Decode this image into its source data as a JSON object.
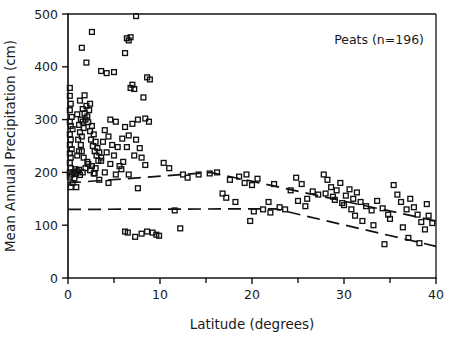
{
  "chart_data": {
    "type": "scatter",
    "title": "",
    "annotation": "Peats (n=196)",
    "xlabel": "Latitude (degrees)",
    "ylabel": "Mean Annual Precipitation (cm)",
    "xlim": [
      0,
      40
    ],
    "ylim": [
      0,
      500
    ],
    "xticks": [
      0,
      10,
      20,
      30,
      40
    ],
    "xticklabels": [
      "0",
      "10",
      "20",
      "30",
      "40"
    ],
    "xminorticks": [
      5,
      15,
      25,
      35
    ],
    "yticks": [
      0,
      100,
      200,
      300,
      400,
      500
    ],
    "yticklabels": [
      "0",
      "100",
      "200",
      "300",
      "400",
      "500"
    ],
    "grid": false,
    "legend": null,
    "marker": "open-square",
    "marker_color": "#111111",
    "n_points": 196,
    "series": [
      {
        "name": "Peats",
        "points": [
          [
            0.2,
            360
          ],
          [
            0.2,
            345
          ],
          [
            0.3,
            330
          ],
          [
            0.2,
            318
          ],
          [
            0.4,
            305
          ],
          [
            0.2,
            296
          ],
          [
            0.3,
            288
          ],
          [
            0.5,
            282
          ],
          [
            0.2,
            272
          ],
          [
            0.3,
            262
          ],
          [
            0.2,
            252
          ],
          [
            0.4,
            244
          ],
          [
            0.2,
            236
          ],
          [
            0.3,
            228
          ],
          [
            0.2,
            218
          ],
          [
            0.3,
            208
          ],
          [
            0.2,
            200
          ],
          [
            0.4,
            196
          ],
          [
            0.2,
            192
          ],
          [
            0.6,
            200
          ],
          [
            0.8,
            206
          ],
          [
            0.9,
            198
          ],
          [
            1.0,
            202
          ],
          [
            1.2,
            205
          ],
          [
            0.7,
            188
          ],
          [
            0.5,
            180
          ],
          [
            0.3,
            172
          ],
          [
            0.9,
            172
          ],
          [
            1.3,
            195
          ],
          [
            1.6,
            200
          ],
          [
            1.0,
            232
          ],
          [
            1.2,
            240
          ],
          [
            1.4,
            252
          ],
          [
            1.1,
            262
          ],
          [
            1.5,
            268
          ],
          [
            1.3,
            276
          ],
          [
            1.7,
            284
          ],
          [
            1.6,
            296
          ],
          [
            1.9,
            300
          ],
          [
            2.1,
            306
          ],
          [
            1.8,
            312
          ],
          [
            2.3,
            318
          ],
          [
            2.0,
            326
          ],
          [
            2.4,
            330
          ],
          [
            2.2,
            295
          ],
          [
            2.6,
            288
          ],
          [
            2.4,
            278
          ],
          [
            2.8,
            272
          ],
          [
            2.5,
            262
          ],
          [
            3.0,
            258
          ],
          [
            2.7,
            250
          ],
          [
            3.2,
            246
          ],
          [
            2.9,
            240
          ],
          [
            3.4,
            238
          ],
          [
            3.1,
            232
          ],
          [
            3.6,
            228
          ],
          [
            3.3,
            222
          ],
          [
            2.2,
            216
          ],
          [
            2.6,
            212
          ],
          [
            3.0,
            208
          ],
          [
            2.4,
            204
          ],
          [
            2.8,
            198
          ],
          [
            1.9,
            208
          ],
          [
            2.1,
            220
          ],
          [
            1.7,
            228
          ],
          [
            1.5,
            240
          ],
          [
            1.2,
            290
          ],
          [
            1.4,
            300
          ],
          [
            1.0,
            310
          ],
          [
            1.6,
            320
          ],
          [
            1.3,
            336
          ],
          [
            1.8,
            346
          ],
          [
            2.0,
            408
          ],
          [
            1.5,
            436
          ],
          [
            2.6,
            466
          ],
          [
            3.6,
            392
          ],
          [
            4.2,
            388
          ],
          [
            5.0,
            390
          ],
          [
            4.6,
            300
          ],
          [
            5.2,
            296
          ],
          [
            4.0,
            280
          ],
          [
            4.4,
            268
          ],
          [
            3.8,
            258
          ],
          [
            4.8,
            252
          ],
          [
            5.4,
            248
          ],
          [
            4.2,
            238
          ],
          [
            5.0,
            232
          ],
          [
            3.6,
            222
          ],
          [
            4.6,
            216
          ],
          [
            5.6,
            212
          ],
          [
            4.0,
            200
          ],
          [
            5.2,
            196
          ],
          [
            3.4,
            186
          ],
          [
            4.4,
            180
          ],
          [
            2.9,
            198
          ],
          [
            6.4,
            454
          ],
          [
            6.8,
            456
          ],
          [
            6.6,
            450
          ],
          [
            6.2,
            426
          ],
          [
            7.4,
            496
          ],
          [
            7.0,
            366
          ],
          [
            6.8,
            360
          ],
          [
            7.2,
            358
          ],
          [
            8.6,
            380
          ],
          [
            8.9,
            376
          ],
          [
            8.2,
            342
          ],
          [
            8.4,
            302
          ],
          [
            8.8,
            296
          ],
          [
            7.6,
            300
          ],
          [
            7.0,
            292
          ],
          [
            6.2,
            286
          ],
          [
            6.6,
            270
          ],
          [
            7.4,
            262
          ],
          [
            5.9,
            264
          ],
          [
            6.4,
            248
          ],
          [
            7.8,
            246
          ],
          [
            7.2,
            232
          ],
          [
            8.0,
            228
          ],
          [
            6.0,
            220
          ],
          [
            8.4,
            214
          ],
          [
            5.8,
            206
          ],
          [
            6.6,
            196
          ],
          [
            7.6,
            170
          ],
          [
            6.2,
            88
          ],
          [
            6.5,
            86
          ],
          [
            7.3,
            78
          ],
          [
            8.0,
            84
          ],
          [
            8.6,
            88
          ],
          [
            9.2,
            86
          ],
          [
            9.6,
            82
          ],
          [
            9.9,
            80
          ],
          [
            11.0,
            208
          ],
          [
            10.4,
            218
          ],
          [
            12.5,
            196
          ],
          [
            13.0,
            190
          ],
          [
            11.6,
            128
          ],
          [
            14.2,
            196
          ],
          [
            15.4,
            198
          ],
          [
            16.2,
            200
          ],
          [
            12.2,
            94
          ],
          [
            16.8,
            160
          ],
          [
            17.6,
            186
          ],
          [
            17.2,
            152
          ],
          [
            18.6,
            192
          ],
          [
            19.2,
            180
          ],
          [
            18.2,
            144
          ],
          [
            20.0,
            176
          ],
          [
            19.4,
            196
          ],
          [
            20.6,
            188
          ],
          [
            21.2,
            130
          ],
          [
            20.2,
            126
          ],
          [
            21.8,
            144
          ],
          [
            22.4,
            178
          ],
          [
            22.0,
            124
          ],
          [
            23.0,
            134
          ],
          [
            19.8,
            108
          ],
          [
            23.6,
            130
          ],
          [
            24.2,
            166
          ],
          [
            24.8,
            190
          ],
          [
            25.4,
            178
          ],
          [
            25.0,
            146
          ],
          [
            26.0,
            150
          ],
          [
            26.6,
            164
          ],
          [
            27.2,
            158
          ],
          [
            25.8,
            136
          ],
          [
            27.8,
            196
          ],
          [
            28.2,
            186
          ],
          [
            28.6,
            172
          ],
          [
            28.0,
            160
          ],
          [
            28.8,
            154
          ],
          [
            29.2,
            166
          ],
          [
            29.6,
            180
          ],
          [
            29.0,
            148
          ],
          [
            29.8,
            142
          ],
          [
            30.2,
            156
          ],
          [
            30.6,
            168
          ],
          [
            30.0,
            138
          ],
          [
            31.0,
            150
          ],
          [
            31.4,
            162
          ],
          [
            30.8,
            130
          ],
          [
            31.8,
            144
          ],
          [
            32.4,
            136
          ],
          [
            31.2,
            118
          ],
          [
            32.0,
            108
          ],
          [
            33.0,
            128
          ],
          [
            33.6,
            146
          ],
          [
            34.2,
            132
          ],
          [
            34.8,
            120
          ],
          [
            33.2,
            100
          ],
          [
            34.4,
            64
          ],
          [
            35.4,
            176
          ],
          [
            35.8,
            158
          ],
          [
            36.2,
            144
          ],
          [
            36.8,
            130
          ],
          [
            35.0,
            112
          ],
          [
            36.4,
            96
          ],
          [
            37.2,
            150
          ],
          [
            37.6,
            134
          ],
          [
            38.0,
            120
          ],
          [
            37.0,
            76
          ],
          [
            38.4,
            106
          ],
          [
            38.8,
            92
          ],
          [
            39.2,
            118
          ],
          [
            39.6,
            104
          ],
          [
            38.2,
            66
          ],
          [
            39.0,
            140
          ]
        ]
      }
    ],
    "trend_lines": [
      {
        "name": "upper-dashed-trend",
        "style": "dashed",
        "vertices": [
          [
            0,
            180
          ],
          [
            15.5,
            200
          ],
          [
            40,
            108
          ]
        ]
      },
      {
        "name": "lower-dashed-trend",
        "style": "dashed",
        "vertices": [
          [
            0,
            130
          ],
          [
            22.5,
            131
          ],
          [
            40,
            60
          ]
        ]
      }
    ]
  },
  "axes": {
    "x_title": "Latitude (degrees)",
    "y_title": "Mean Annual Precipitation (cm)"
  },
  "annotation": {
    "text": "Peats (n=196)"
  }
}
